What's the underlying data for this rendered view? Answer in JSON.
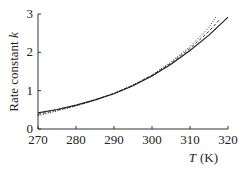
{
  "chart_data": {
    "type": "line",
    "title": "",
    "xlabel": "T (K)",
    "xlabel_italic": "T",
    "xlabel_unit": "(K)",
    "ylabel": "Rate constant k",
    "ylabel_text": "Rate constant",
    "ylabel_italic": "k",
    "xlim": [
      270,
      320
    ],
    "ylim": [
      0,
      3
    ],
    "xticks": [
      270,
      280,
      290,
      300,
      310,
      320
    ],
    "yticks": [
      0,
      1,
      2,
      3
    ],
    "grid": false,
    "legend": null,
    "series": [
      {
        "name": "solid",
        "style": "solid",
        "x": [
          270,
          275,
          280,
          285,
          290,
          295,
          300,
          305,
          310,
          315,
          320
        ],
        "y": [
          0.42,
          0.51,
          0.62,
          0.76,
          0.92,
          1.13,
          1.38,
          1.69,
          2.05,
          2.45,
          2.92
        ]
      },
      {
        "name": "dashed",
        "style": "dashed",
        "x": [
          270,
          275,
          280,
          285,
          290,
          295,
          300,
          305,
          310,
          315,
          318
        ],
        "y": [
          0.38,
          0.49,
          0.61,
          0.76,
          0.93,
          1.14,
          1.4,
          1.72,
          2.1,
          2.55,
          2.88
        ]
      },
      {
        "name": "dotted",
        "style": "dotted",
        "x": [
          270,
          275,
          280,
          285,
          290,
          295,
          300,
          305,
          310,
          315,
          317
        ],
        "y": [
          0.35,
          0.47,
          0.6,
          0.75,
          0.93,
          1.15,
          1.41,
          1.75,
          2.15,
          2.65,
          2.95
        ]
      }
    ]
  }
}
